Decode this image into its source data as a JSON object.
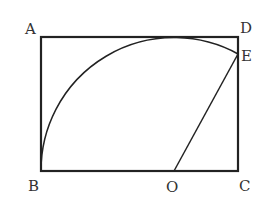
{
  "diagram": {
    "stroke_color": "#222222",
    "label_color": "#333333",
    "points": {
      "A": {
        "label": "A",
        "x": 41,
        "y": 37
      },
      "D": {
        "label": "D",
        "x": 238,
        "y": 37
      },
      "E": {
        "label": "E",
        "x": 238,
        "y": 54
      },
      "B": {
        "label": "B",
        "x": 41,
        "y": 171
      },
      "O": {
        "label": "O",
        "x": 174,
        "y": 171
      },
      "C": {
        "label": "C",
        "x": 238,
        "y": 171
      }
    },
    "segments": [
      "AB",
      "BC",
      "CD",
      "DA",
      "OE"
    ],
    "arc": {
      "center": "O",
      "from": "B",
      "to": "E",
      "radius": 133
    }
  }
}
